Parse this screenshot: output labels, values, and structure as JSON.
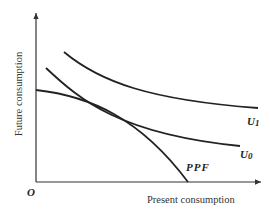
{
  "diagram": {
    "type": "economics-intertemporal-choice",
    "x_axis_label": "Present consumption",
    "y_axis_label": "Future consumption",
    "origin_label": "O",
    "curves": [
      {
        "id": "U1",
        "label_main": "U",
        "label_sub": "1",
        "kind": "indifference-curve",
        "color": "#222222"
      },
      {
        "id": "U0",
        "label_main": "U",
        "label_sub": "0",
        "kind": "indifference-curve",
        "color": "#222222"
      },
      {
        "id": "PPF",
        "label": "PPF",
        "kind": "production-possibilities-frontier",
        "color": "#222222"
      }
    ],
    "colors": {
      "line": "#222222",
      "axis": "#333333",
      "background": "#ffffff"
    }
  }
}
